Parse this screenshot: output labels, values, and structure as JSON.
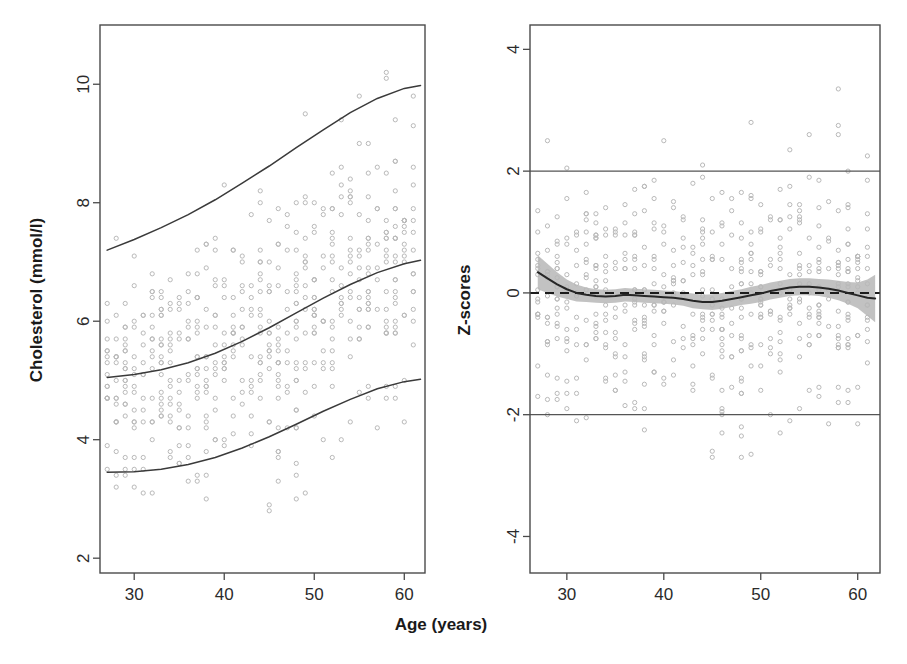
{
  "figure": {
    "background_color": "#ffffff",
    "point_color": "#b9b9b9",
    "line_color": "#3a3a3a",
    "band_color": "#a8a8a8"
  },
  "chart_data": [
    {
      "type": "scatter",
      "panel": "left",
      "title": "",
      "xlabel": "Age (years)",
      "ylabel": "Cholesterol (mmol/l)",
      "xlim": [
        26.2,
        62.3
      ],
      "ylim": [
        1.75,
        11.0
      ],
      "xticks": [
        30,
        40,
        50,
        60
      ],
      "xtick_labels": [
        "30",
        "40",
        "50",
        "60"
      ],
      "yticks": [
        2,
        4,
        6,
        8,
        10
      ],
      "ytick_labels": [
        "2",
        "4",
        "6",
        "8",
        "10"
      ],
      "grid": false,
      "legend": "none",
      "series": [
        {
          "name": "upper centile curve",
          "type": "line",
          "x": [
            27.0,
            30.0,
            33.0,
            36.0,
            39.0,
            42.0,
            45.0,
            48.0,
            51.0,
            54.0,
            57.0,
            60.0,
            61.8
          ],
          "y": [
            7.2,
            7.38,
            7.58,
            7.8,
            8.05,
            8.33,
            8.62,
            8.93,
            9.23,
            9.52,
            9.76,
            9.93,
            9.98
          ]
        },
        {
          "name": "median centile curve",
          "type": "line",
          "x": [
            27.0,
            30.0,
            33.0,
            36.0,
            39.0,
            42.0,
            45.0,
            48.0,
            51.0,
            54.0,
            57.0,
            60.0,
            61.8
          ],
          "y": [
            5.05,
            5.1,
            5.18,
            5.3,
            5.46,
            5.66,
            5.89,
            6.14,
            6.39,
            6.62,
            6.82,
            6.97,
            7.03
          ]
        },
        {
          "name": "lower centile curve",
          "type": "line",
          "x": [
            27.0,
            30.0,
            33.0,
            36.0,
            39.0,
            42.0,
            45.0,
            48.0,
            51.0,
            54.0,
            57.0,
            60.0,
            61.8
          ],
          "y": [
            3.45,
            3.46,
            3.5,
            3.58,
            3.7,
            3.86,
            4.05,
            4.26,
            4.48,
            4.68,
            4.86,
            4.98,
            5.02
          ]
        }
      ],
      "scatter_note": "approximately 560 observations of cholesterol by age, plotted as small open circles"
    },
    {
      "type": "scatter",
      "panel": "right",
      "title": "",
      "xlabel": "Age (years)",
      "ylabel": "Z-scores",
      "xlim": [
        26.2,
        62.3
      ],
      "ylim": [
        -4.6,
        4.4
      ],
      "xticks": [
        30,
        40,
        50,
        60
      ],
      "xtick_labels": [
        "30",
        "40",
        "50",
        "60"
      ],
      "yticks": [
        -4,
        -2,
        0,
        2,
        4
      ],
      "ytick_labels": [
        "-4",
        "-2",
        "0",
        "2",
        "4"
      ],
      "grid": false,
      "legend": "none",
      "reference_lines": [
        {
          "name": "upper-reference-line",
          "y": 2,
          "style": "solid"
        },
        {
          "name": "lower-reference-line",
          "y": -2,
          "style": "solid"
        },
        {
          "name": "zero-line",
          "y": 0,
          "style": "dashed"
        }
      ],
      "series": [
        {
          "name": "loess smoother",
          "type": "line",
          "x": [
            27.0,
            28.0,
            29.0,
            30.0,
            31.0,
            32.0,
            33.0,
            34.0,
            35.0,
            36.0,
            37.0,
            38.0,
            39.0,
            40.0,
            41.0,
            42.0,
            43.0,
            44.0,
            45.0,
            46.0,
            47.0,
            48.0,
            49.0,
            50.0,
            51.0,
            52.0,
            53.0,
            54.0,
            55.0,
            56.0,
            57.0,
            58.0,
            59.0,
            60.0,
            61.0,
            61.8
          ],
          "y": [
            0.34,
            0.24,
            0.14,
            0.06,
            0.0,
            -0.03,
            -0.05,
            -0.06,
            -0.05,
            -0.03,
            -0.04,
            -0.05,
            -0.06,
            -0.07,
            -0.08,
            -0.1,
            -0.13,
            -0.15,
            -0.15,
            -0.13,
            -0.1,
            -0.07,
            -0.04,
            -0.01,
            0.03,
            0.06,
            0.09,
            0.1,
            0.1,
            0.09,
            0.07,
            0.04,
            0.0,
            -0.04,
            -0.08,
            -0.09
          ]
        },
        {
          "name": "loess 95% confidence band upper",
          "type": "line",
          "x": [
            27.0,
            28.0,
            29.0,
            30.0,
            31.0,
            32.0,
            33.0,
            34.0,
            35.0,
            36.0,
            37.0,
            38.0,
            39.0,
            40.0,
            41.0,
            42.0,
            43.0,
            44.0,
            45.0,
            46.0,
            47.0,
            48.0,
            49.0,
            50.0,
            51.0,
            52.0,
            53.0,
            54.0,
            55.0,
            56.0,
            57.0,
            58.0,
            59.0,
            60.0,
            61.0,
            61.8
          ],
          "y": [
            0.62,
            0.48,
            0.34,
            0.22,
            0.14,
            0.09,
            0.06,
            0.05,
            0.06,
            0.08,
            0.07,
            0.06,
            0.05,
            0.04,
            0.03,
            0.01,
            -0.01,
            -0.03,
            -0.02,
            0.0,
            0.03,
            0.06,
            0.1,
            0.13,
            0.17,
            0.2,
            0.23,
            0.24,
            0.24,
            0.23,
            0.22,
            0.2,
            0.18,
            0.17,
            0.22,
            0.3
          ]
        },
        {
          "name": "loess 95% confidence band lower",
          "type": "line",
          "x": [
            27.0,
            28.0,
            29.0,
            30.0,
            31.0,
            32.0,
            33.0,
            34.0,
            35.0,
            36.0,
            37.0,
            38.0,
            39.0,
            40.0,
            41.0,
            42.0,
            43.0,
            44.0,
            45.0,
            46.0,
            47.0,
            48.0,
            49.0,
            50.0,
            51.0,
            52.0,
            53.0,
            54.0,
            55.0,
            56.0,
            57.0,
            58.0,
            59.0,
            60.0,
            61.0,
            61.8
          ],
          "y": [
            0.06,
            0.0,
            -0.06,
            -0.1,
            -0.14,
            -0.15,
            -0.16,
            -0.17,
            -0.16,
            -0.14,
            -0.15,
            -0.16,
            -0.17,
            -0.18,
            -0.19,
            -0.21,
            -0.25,
            -0.27,
            -0.28,
            -0.26,
            -0.23,
            -0.2,
            -0.18,
            -0.15,
            -0.11,
            -0.08,
            -0.05,
            -0.04,
            -0.04,
            -0.05,
            -0.08,
            -0.12,
            -0.18,
            -0.25,
            -0.38,
            -0.48
          ]
        }
      ],
      "scatter_note": "approximately 560 z-score residuals by age, plotted as small open circles"
    }
  ]
}
